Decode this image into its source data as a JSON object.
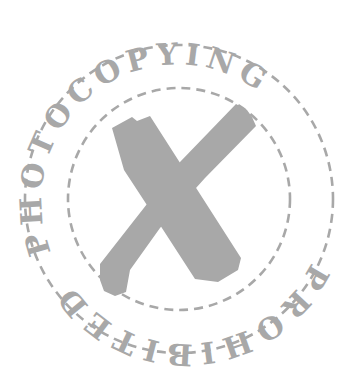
{
  "stamp": {
    "top_text": "PHOTOCOPYING",
    "bottom_text": "PROHIBITED",
    "center_icon": "x-mark-icon",
    "colors": {
      "ink": "#a8a8a8",
      "background": "#ffffff"
    }
  }
}
